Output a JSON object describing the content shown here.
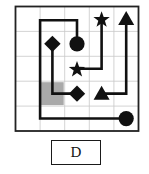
{
  "grid": {
    "cols": 5,
    "rows": 5,
    "x0": 15.5,
    "y0": 6.5,
    "cell_w": 24.6,
    "cell_h": 24.9,
    "grid_line_color": "#c8c8c8",
    "border_color": "#222222",
    "path_color": "#111111",
    "shaded_color": "#a9a9a9"
  },
  "shaded_cells": [
    {
      "col": 1,
      "row": 3
    }
  ],
  "shapes": [
    {
      "type": "star",
      "col": 3,
      "row": 0
    },
    {
      "type": "triangle",
      "col": 4,
      "row": 0
    },
    {
      "type": "diamond",
      "col": 1,
      "row": 1
    },
    {
      "type": "circle",
      "col": 2,
      "row": 1
    },
    {
      "type": "star",
      "col": 2,
      "row": 2
    },
    {
      "type": "diamond",
      "col": 2,
      "row": 3
    },
    {
      "type": "triangle",
      "col": 3,
      "row": 3
    },
    {
      "type": "circle",
      "col": 4,
      "row": 4
    }
  ],
  "paths": [
    {
      "name": "circle-path",
      "points": [
        [
          2,
          1
        ],
        [
          2,
          0.05
        ],
        [
          0.5,
          0.05
        ],
        [
          0.5,
          4
        ],
        [
          4,
          4
        ]
      ]
    },
    {
      "name": "diamond-path",
      "points": [
        [
          1,
          1
        ],
        [
          1,
          3
        ],
        [
          2,
          3
        ]
      ]
    },
    {
      "name": "star-path",
      "points": [
        [
          2,
          2
        ],
        [
          3,
          2
        ],
        [
          3,
          0
        ]
      ]
    },
    {
      "name": "triangle-path",
      "points": [
        [
          3,
          3
        ],
        [
          4,
          3
        ],
        [
          4,
          0
        ]
      ]
    }
  ],
  "option": {
    "label": "D"
  }
}
